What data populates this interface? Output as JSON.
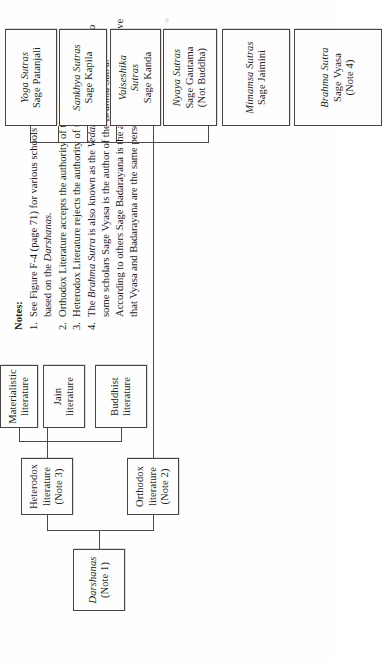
{
  "figure": {
    "title_note": "Darshanas tree diagram",
    "orientation": "rotated-90",
    "notes": {
      "heading": "Notes:",
      "items": [
        {
          "number": "1.",
          "text": "See Figure F-4 (page 71) for various schools of Hindu philosophy based on the Darshanas.",
          "italic_terms": [
            "Darshanas"
          ]
        },
        {
          "number": "2.",
          "text": "Orthodox Literature accepts the authority of the Vedas.",
          "italic_terms": []
        },
        {
          "number": "3.",
          "text": "Heterodox Literature rejects the authority of the Vedas.",
          "italic_terms": []
        },
        {
          "number": "4.",
          "text": "The Brahma Sutra is also known as the Vedanta Sutra.  According to some scholars Sage Vyasa is the author of the Brahma Sutra.  According to others Sage Badarayana is the author; still others believe that Vyasa and Badarayana are the same person.",
          "italic_terms": [
            "Brahma Sutra",
            "Vedanta Sutra",
            "Brahma Sutra"
          ]
        }
      ]
    },
    "nodes": {
      "root": {
        "line1": "Darshanas",
        "line2": "(Note 1)"
      },
      "orthodox": {
        "line1": "Orthodox",
        "line2": "literature",
        "line3": "(Note 2)"
      },
      "heterodox": {
        "line1": "Heterodox",
        "line2": "literature",
        "line3": "(Note 3)"
      },
      "buddhist": {
        "line1": "Buddhist",
        "line2": "literature"
      },
      "jain": {
        "line1": "Jain",
        "line2": "literature"
      },
      "materialistic": {
        "line1": "Materialistic",
        "line2": "literature"
      },
      "brahma": {
        "line1": "Brahma Sutra",
        "line2": "Sage Vyasa",
        "line3": "(Note 4)"
      },
      "mimamsa": {
        "line1": "Mimamsa Sutras",
        "line2": "Sage Jaimini"
      },
      "nyaya": {
        "line1": "Nyaya Sutras",
        "line2": "Sage Gautama",
        "line3": "(Not Buddha)"
      },
      "vaiseshika": {
        "line1": "Vaiseshika",
        "line2": "Sutras",
        "line3": "Sage Kanda"
      },
      "sankhya": {
        "line1": "Sankhya Sutras",
        "line2": "Sage Kapila"
      },
      "yoga": {
        "line1": "Yoga Sutras",
        "line2": "Sage Patanjali"
      }
    },
    "colors": {
      "ink": "#231f1d",
      "rule": "#4f4946",
      "paper": "#ffffff"
    }
  }
}
